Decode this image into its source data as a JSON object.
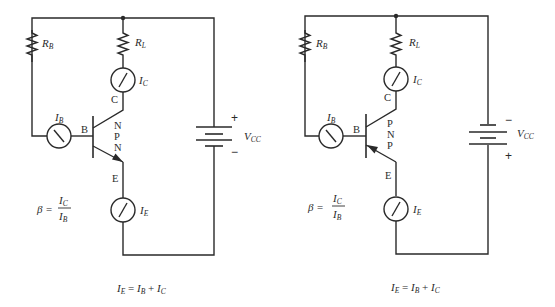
{
  "circuits": [
    {
      "type": "NPN",
      "resistors": {
        "base": "R",
        "base_sub": "B",
        "load": "R",
        "load_sub": "L"
      },
      "meters": {
        "base_current": {
          "symbol": "I",
          "sub": "B"
        },
        "collector_current": {
          "symbol": "I",
          "sub": "C"
        },
        "emitter_current": {
          "symbol": "I",
          "sub": "E"
        }
      },
      "terminals": {
        "base": "B",
        "collector": "C",
        "emitter": "E"
      },
      "layers": [
        "N",
        "P",
        "N"
      ],
      "supply": {
        "symbol": "V",
        "sub": "CC",
        "top_sign": "+",
        "bottom_sign": "−"
      },
      "beta_formula": {
        "lhs": "β =",
        "num": "I",
        "num_sub": "C",
        "den": "I",
        "den_sub": "B"
      },
      "current_equation": {
        "lhs": "I",
        "lhs_sub": "E",
        "eq": " = ",
        "a": "I",
        "a_sub": "B",
        "plus": " + ",
        "b": "I",
        "b_sub": "C"
      }
    },
    {
      "type": "PNP",
      "resistors": {
        "base": "R",
        "base_sub": "B",
        "load": "R",
        "load_sub": "L"
      },
      "meters": {
        "base_current": {
          "symbol": "I",
          "sub": "B"
        },
        "collector_current": {
          "symbol": "I",
          "sub": "C"
        },
        "emitter_current": {
          "symbol": "I",
          "sub": "E"
        }
      },
      "terminals": {
        "base": "B",
        "collector": "C",
        "emitter": "E"
      },
      "layers": [
        "P",
        "N",
        "P"
      ],
      "supply": {
        "symbol": "V",
        "sub": "CC",
        "top_sign": "−",
        "bottom_sign": "+"
      },
      "beta_formula": {
        "lhs": "β =",
        "num": "I",
        "num_sub": "C",
        "den": "I",
        "den_sub": "B"
      },
      "current_equation": {
        "lhs": "I",
        "lhs_sub": "E",
        "eq": " = ",
        "a": "I",
        "a_sub": "B",
        "plus": " + ",
        "b": "I",
        "b_sub": "C"
      }
    }
  ]
}
